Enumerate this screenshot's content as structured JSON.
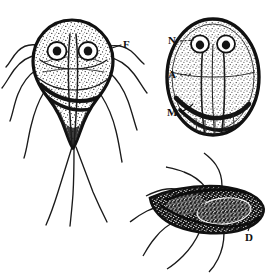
{
  "figure": {
    "kind": "scientific-line-illustration",
    "background_color": "#ffffff",
    "ink_color": "#111111"
  },
  "labels": {
    "flagella": "F",
    "nucleus": "N",
    "axostyle": "A",
    "median_body": "M",
    "disc": "D"
  },
  "panels": [
    {
      "id": "trophozoite-front",
      "label": "F",
      "view": "ventral-front",
      "nuclei_count": 2,
      "flagella_count": 8
    },
    {
      "id": "cyst",
      "labels": [
        "N",
        "A",
        "M"
      ],
      "view": "oval-cyst",
      "nuclei_count": 2,
      "flagella_count": 0
    },
    {
      "id": "trophozoite-lateral",
      "label": "D",
      "view": "lateral",
      "nuclei_count": 0,
      "flagella_count": 7
    }
  ]
}
